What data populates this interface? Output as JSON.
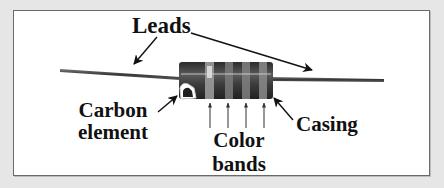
{
  "figure": {
    "labels": {
      "leads": "Leads",
      "carbon_line1": "Carbon",
      "carbon_line2": "element",
      "bands_line1": "Color",
      "bands_line2": "bands",
      "casing": "Casing"
    },
    "colors": {
      "background": "#e6e6e6",
      "panel": "#ffffff",
      "panel_border": "#6a6a6a",
      "lead": "#4a4a4a",
      "body": "#3a3a3a",
      "band_light": "#d9d9d9",
      "band_mid": "#8a8a8a",
      "arrow": "#111111"
    },
    "color_band_count": 4
  }
}
